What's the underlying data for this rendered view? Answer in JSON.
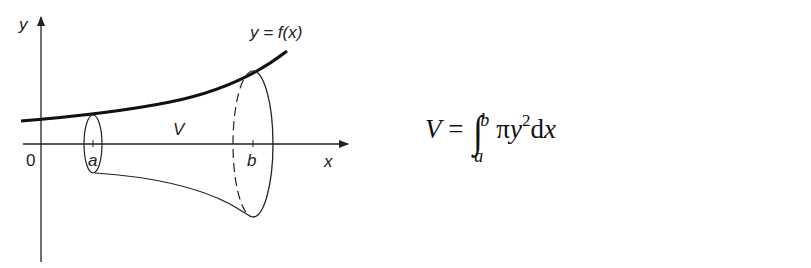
{
  "diagram": {
    "type": "solid-of-revolution",
    "axes": {
      "x_label": "x",
      "y_label": "y",
      "origin_label": "0"
    },
    "curve_label": "y = f(x)",
    "volume_label": "V",
    "bounds": {
      "lower": "a",
      "upper": "b"
    }
  },
  "formula": {
    "lhs": "V",
    "equals": "=",
    "integral": "∫",
    "upper_limit": "b",
    "lower_limit": "a",
    "pi": "π",
    "var": "y",
    "power": "2",
    "d": "d",
    "dx_var": "x"
  }
}
